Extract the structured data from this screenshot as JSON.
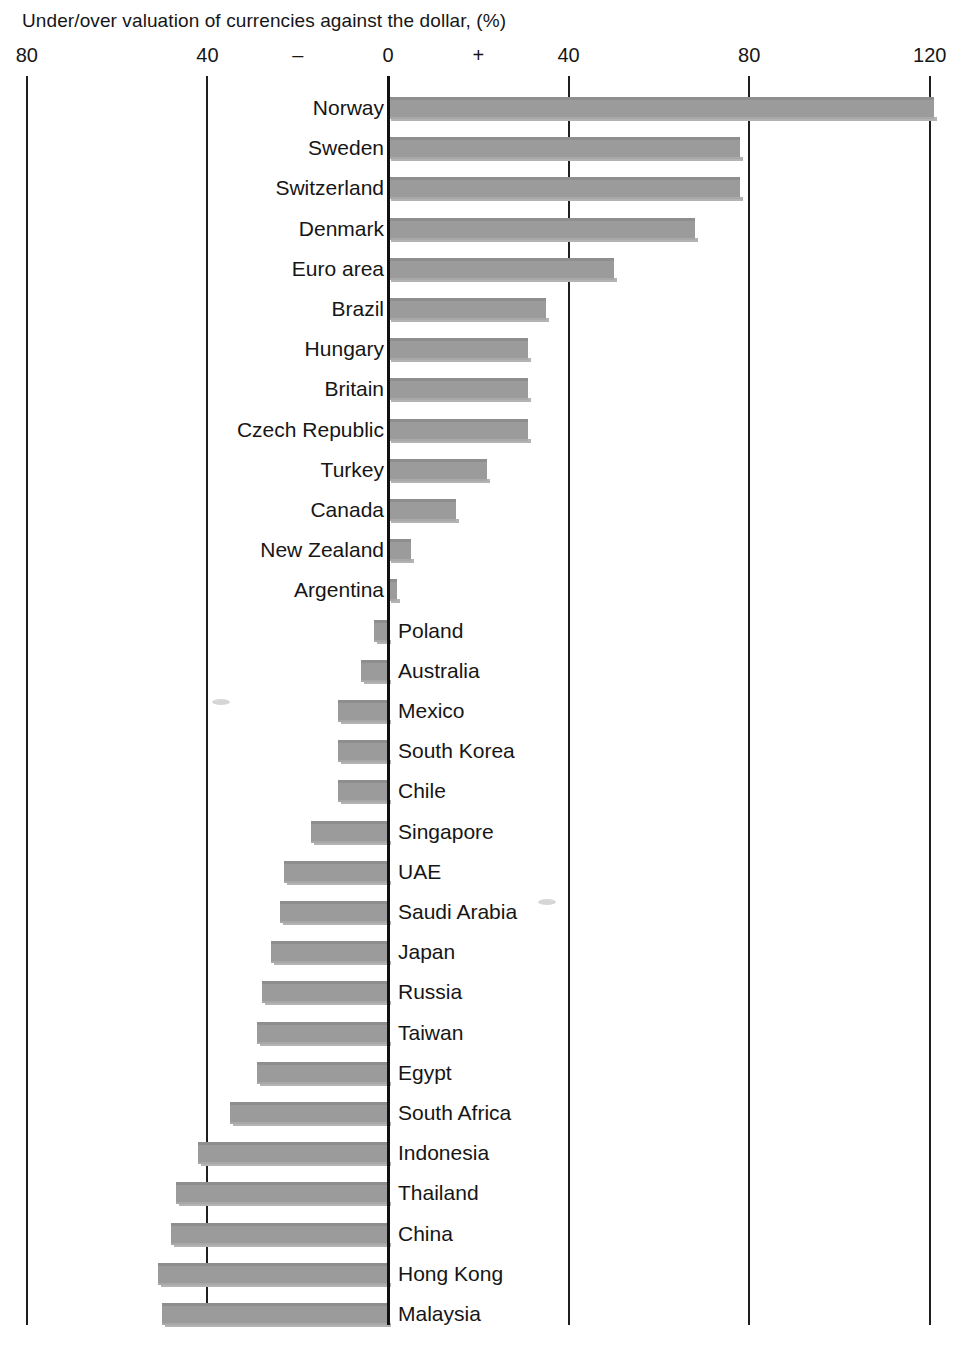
{
  "chart_data": {
    "type": "bar",
    "title": "Under/over valuation of currencies against the dollar, (%)",
    "xlabel": "",
    "ylabel": "",
    "xlim": [
      -80,
      120
    ],
    "grid": true,
    "orientation": "horizontal",
    "axis_ticks": [
      {
        "value": -80,
        "label": "80"
      },
      {
        "value": -40,
        "label": "40"
      },
      {
        "value": -20,
        "label": "–"
      },
      {
        "value": 0,
        "label": "0"
      },
      {
        "value": 20,
        "label": "+"
      },
      {
        "value": 40,
        "label": "40"
      },
      {
        "value": 80,
        "label": "80"
      },
      {
        "value": 120,
        "label": "120"
      }
    ],
    "gridline_values": [
      -80,
      -40,
      0,
      40,
      80,
      120
    ],
    "sign_markers": {
      "negative": "–",
      "positive": "+"
    },
    "categories": [
      "Norway",
      "Sweden",
      "Switzerland",
      "Denmark",
      "Euro area",
      "Brazil",
      "Hungary",
      "Britain",
      "Czech Republic",
      "Turkey",
      "Canada",
      "New Zealand",
      "Argentina",
      "Poland",
      "Australia",
      "Mexico",
      "South Korea",
      "Chile",
      "Singapore",
      "UAE",
      "Saudi Arabia",
      "Japan",
      "Russia",
      "Taiwan",
      "Egypt",
      "South Africa",
      "Indonesia",
      "Thailand",
      "China",
      "Hong Kong",
      "Malaysia"
    ],
    "values": [
      121,
      78,
      78,
      68,
      50,
      35,
      31,
      31,
      31,
      22,
      15,
      5,
      2,
      -3,
      -6,
      -11,
      -11,
      -11,
      -17,
      -23,
      -24,
      -26,
      -28,
      -29,
      -29,
      -35,
      -42,
      -47,
      -48,
      -51,
      -50
    ],
    "series": [
      {
        "name": "Under/over valuation vs dollar (%)",
        "color": "#9b9b9b",
        "points": [
          {
            "label": "Norway",
            "value": 121
          },
          {
            "label": "Sweden",
            "value": 78
          },
          {
            "label": "Switzerland",
            "value": 78
          },
          {
            "label": "Denmark",
            "value": 68
          },
          {
            "label": "Euro area",
            "value": 50
          },
          {
            "label": "Brazil",
            "value": 35
          },
          {
            "label": "Hungary",
            "value": 31
          },
          {
            "label": "Britain",
            "value": 31
          },
          {
            "label": "Czech Republic",
            "value": 31
          },
          {
            "label": "Turkey",
            "value": 22
          },
          {
            "label": "Canada",
            "value": 15
          },
          {
            "label": "New Zealand",
            "value": 5
          },
          {
            "label": "Argentina",
            "value": 2
          },
          {
            "label": "Poland",
            "value": -3
          },
          {
            "label": "Australia",
            "value": -6
          },
          {
            "label": "Mexico",
            "value": -11
          },
          {
            "label": "South Korea",
            "value": -11
          },
          {
            "label": "Chile",
            "value": -11
          },
          {
            "label": "Singapore",
            "value": -17
          },
          {
            "label": "UAE",
            "value": -23
          },
          {
            "label": "Saudi Arabia",
            "value": -24
          },
          {
            "label": "Japan",
            "value": -26
          },
          {
            "label": "Russia",
            "value": -28
          },
          {
            "label": "Taiwan",
            "value": -29
          },
          {
            "label": "Egypt",
            "value": -29
          },
          {
            "label": "South Africa",
            "value": -35
          },
          {
            "label": "Indonesia",
            "value": -42
          },
          {
            "label": "Thailand",
            "value": -47
          },
          {
            "label": "China",
            "value": -48
          },
          {
            "label": "Hong Kong",
            "value": -51
          },
          {
            "label": "Malaysia",
            "value": -50
          }
        ]
      }
    ],
    "legend": [],
    "colors": {
      "bar_fill": "#9b9b9b",
      "bar_top_edge": "#8e8e8e",
      "bar_drop_shadow": "#b3b3b3",
      "gridline": "#1e1e1e",
      "zero_axis": "#111111",
      "text": "#161616",
      "background": "#ffffff"
    }
  }
}
